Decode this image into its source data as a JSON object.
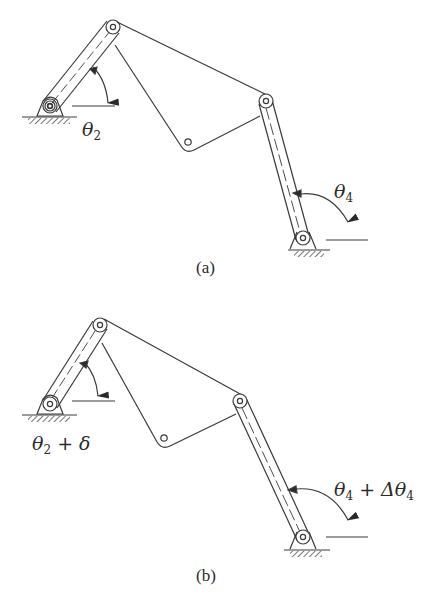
{
  "figure": {
    "stroke_color": "#3a3a3a",
    "background": "#ffffff",
    "panels": [
      {
        "id": "a",
        "caption": "(a)",
        "input_angle": {
          "symbol": "θ",
          "subscript": "2",
          "suffix": ""
        },
        "output_angle": {
          "symbol": "θ",
          "subscript": "4",
          "suffix": ""
        }
      },
      {
        "id": "b",
        "caption": "(b)",
        "input_angle": {
          "symbol": "θ",
          "subscript": "2",
          "suffix": " + δ"
        },
        "output_angle": {
          "symbol": "θ",
          "subscript": "4",
          "suffix": " + Δθ",
          "suffix_subscript": "4"
        }
      }
    ]
  }
}
